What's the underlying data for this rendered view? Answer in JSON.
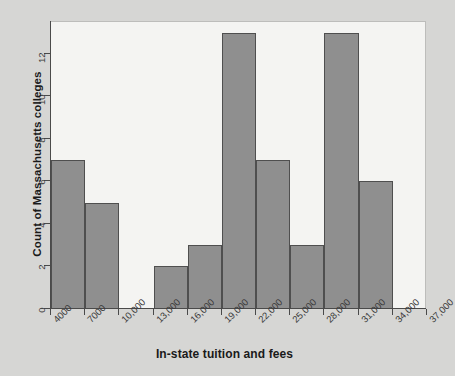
{
  "chart_data": {
    "type": "bar",
    "title": "",
    "xlabel": "In-state tuition and fees",
    "ylabel": "Count of Massachusetts colleges",
    "bin_width": 3000,
    "bin_edges": [
      4000,
      7000,
      10000,
      13000,
      16000,
      19000,
      22000,
      25000,
      28000,
      31000,
      34000,
      37000
    ],
    "categories": [
      "4000-7000",
      "7000-10,000",
      "10,000-13,000",
      "13,000-16,000",
      "16,000-19,000",
      "19,000-22,000",
      "22,000-25,000",
      "25,000-28,000",
      "28,000-31,000",
      "31,000-34,000",
      "34,000-37,000"
    ],
    "values": [
      7,
      5,
      0,
      2,
      3,
      13,
      7,
      3,
      13,
      6,
      0
    ],
    "x_tick_labels": [
      "4000",
      "7000",
      "10,000",
      "13,000",
      "16,000",
      "19,000",
      "22,000",
      "25,000",
      "28,000",
      "31,000",
      "34,000",
      "37,000"
    ],
    "y_tick_labels": [
      "0",
      "2",
      "4",
      "6",
      "8",
      "10",
      "12"
    ],
    "y_tick_values": [
      0,
      2,
      4,
      6,
      8,
      10,
      12
    ],
    "xlim": [
      4000,
      37000
    ],
    "ylim": [
      0,
      13.5
    ],
    "grid": false,
    "legend": null,
    "colors": {
      "bar_fill": "#8f8f8f",
      "bar_stroke": "#4f4f4f",
      "plot_background": "#f4f4f2",
      "page_background": "#d6d6d4",
      "axis": "#4a4a4a",
      "text": "#1a1a1a"
    }
  }
}
